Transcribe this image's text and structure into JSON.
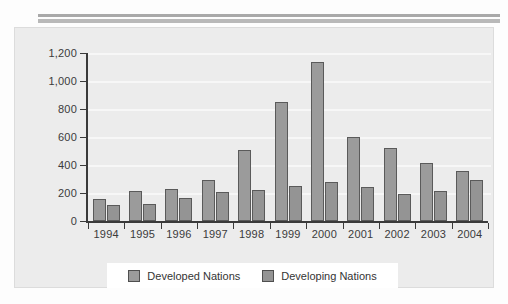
{
  "chart_data": {
    "type": "bar",
    "title": "",
    "xlabel": "",
    "ylabel": "",
    "grid": true,
    "legend_position": "bottom",
    "categories": [
      "1994",
      "1995",
      "1996",
      "1997",
      "1998",
      "1999",
      "2000",
      "2001",
      "2002",
      "2003",
      "2004"
    ],
    "ylim": [
      0,
      1200
    ],
    "yticks": [
      0,
      200,
      400,
      600,
      800,
      1000,
      1200
    ],
    "ytick_labels": [
      "0",
      "200",
      "400",
      "600",
      "800",
      "1,000",
      "1,200"
    ],
    "series": [
      {
        "name": "Developed Nations",
        "color": "#9b9b9b",
        "values": [
          155,
          215,
          230,
          295,
          505,
          850,
          1135,
          600,
          520,
          415,
          360
        ]
      },
      {
        "name": "Developing Nations",
        "color": "#949494",
        "values": [
          115,
          120,
          165,
          205,
          220,
          250,
          280,
          245,
          195,
          215,
          295
        ]
      }
    ]
  },
  "legend": {
    "items": [
      {
        "label": "Developed Nations"
      },
      {
        "label": "Developing Nations"
      }
    ]
  }
}
